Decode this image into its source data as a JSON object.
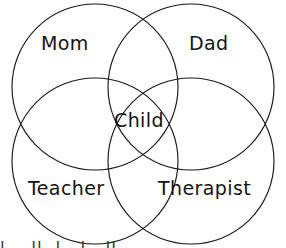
{
  "diagram": {
    "type": "venn-4-circle",
    "background_color": "#ffffff",
    "stroke_color": "#1a1a1a",
    "text_color": "#141414",
    "title": "",
    "circles": [
      {
        "name": "mom",
        "label": "Mom",
        "cx": 95,
        "cy": 87,
        "r": 83
      },
      {
        "name": "dad",
        "label": "Dad",
        "cx": 191,
        "cy": 87,
        "r": 83
      },
      {
        "name": "teacher",
        "label": "Teacher",
        "cx": 95,
        "cy": 161,
        "r": 83
      },
      {
        "name": "therapist",
        "label": "Therapist",
        "cx": 191,
        "cy": 161,
        "r": 83
      }
    ],
    "labels": {
      "mom": "Mom",
      "dad": "Dad",
      "teacher": "Teacher",
      "therapist": "Therapist",
      "intersection": "Child"
    },
    "bottom_cut_text": "l .. ll. l . l . ll"
  }
}
